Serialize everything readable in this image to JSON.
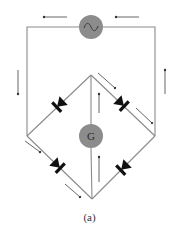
{
  "figure": {
    "caption": "(a)",
    "source_symbol": "~",
    "galvanometer_label": "G",
    "components": {
      "ac_source": "ac-source",
      "galvanometer": "galvanometer",
      "diodes": [
        "diode-top-left",
        "diode-top-right",
        "diode-bottom-left",
        "diode-bottom-right"
      ]
    },
    "colors": {
      "wire": "#8a8a8a",
      "component_fill": "#8c8c8c",
      "diode": "#111111",
      "arrow": "#555555"
    },
    "current_arrows": [
      {
        "position": "top-left of source",
        "direction": "left"
      },
      {
        "position": "top-right of source",
        "direction": "left"
      },
      {
        "position": "left wire",
        "direction": "down"
      },
      {
        "position": "right wire",
        "direction": "up"
      },
      {
        "position": "top-right branch (upper)",
        "direction": "down-right"
      },
      {
        "position": "top-right branch (lower)",
        "direction": "down-right"
      },
      {
        "position": "bottom-left branch (upper)",
        "direction": "down-right"
      },
      {
        "position": "bottom-left branch (lower)",
        "direction": "down-right"
      },
      {
        "position": "center upper",
        "direction": "up"
      },
      {
        "position": "center lower",
        "direction": "up"
      }
    ]
  }
}
